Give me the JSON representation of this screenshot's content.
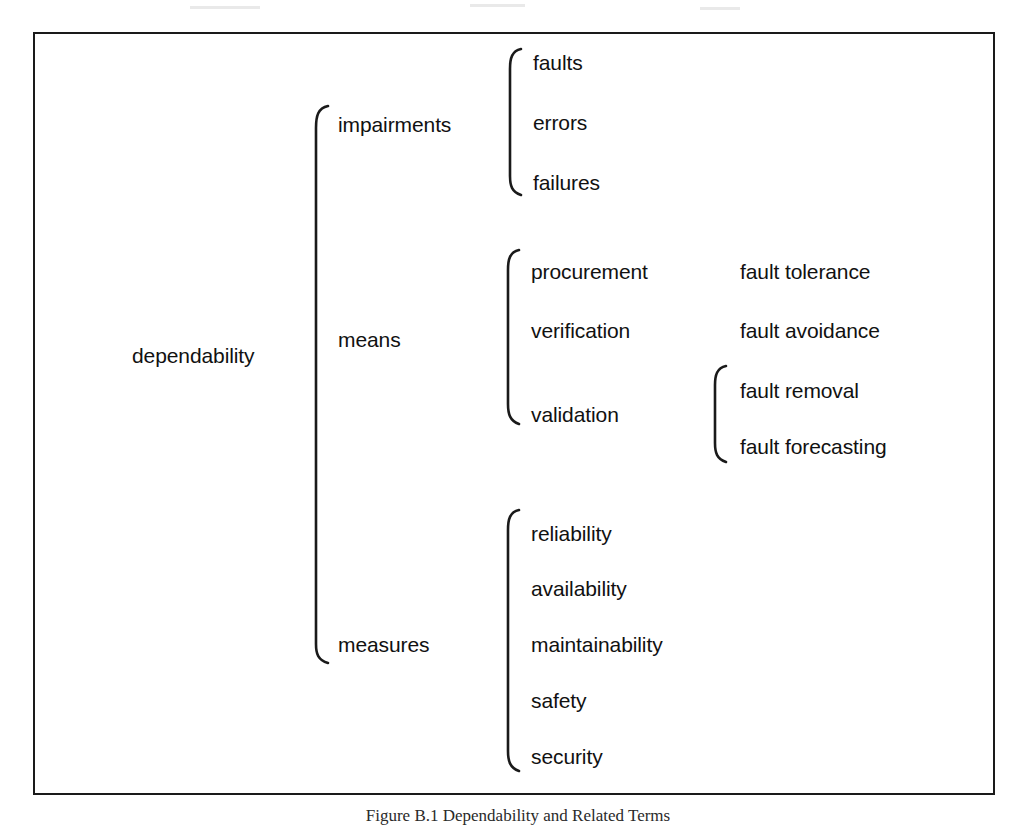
{
  "figure": {
    "caption": "Figure B.1 Dependability and Related Terms",
    "frame_color": "#1a1a1a",
    "text_color": "#111111",
    "background": "#ffffff"
  },
  "tree": {
    "root": {
      "label": "dependability"
    },
    "branches": [
      {
        "label": "impairments",
        "children": [
          {
            "label": "faults"
          },
          {
            "label": "errors"
          },
          {
            "label": "failures"
          }
        ]
      },
      {
        "label": "means",
        "children": [
          {
            "label": "procurement",
            "leaf": "fault tolerance"
          },
          {
            "label": "verification",
            "leaf": "fault avoidance"
          },
          {
            "label": "validation",
            "grandchildren": [
              {
                "label": "fault removal"
              },
              {
                "label": "fault forecasting"
              }
            ]
          }
        ]
      },
      {
        "label": "measures",
        "children": [
          {
            "label": "reliability"
          },
          {
            "label": "availability"
          },
          {
            "label": "maintainability"
          },
          {
            "label": "safety"
          },
          {
            "label": "security"
          }
        ]
      }
    ]
  },
  "labels": {
    "root": "dependability",
    "impairments": "impairments",
    "means": "means",
    "measures": "measures",
    "faults": "faults",
    "errors": "errors",
    "failures": "failures",
    "procurement": "procurement",
    "verification": "verification",
    "validation": "validation",
    "fault_tolerance": "fault tolerance",
    "fault_avoidance": "fault avoidance",
    "fault_removal": "fault removal",
    "fault_forecasting": "fault forecasting",
    "reliability": "reliability",
    "availability": "availability",
    "maintainability": "maintainability",
    "safety": "safety",
    "security": "security"
  }
}
